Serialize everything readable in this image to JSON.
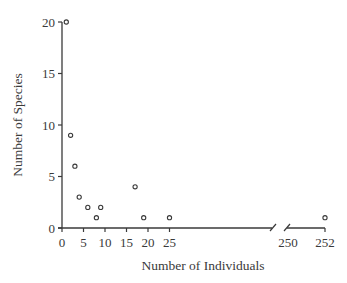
{
  "chart_data": {
    "type": "scatter",
    "title": "",
    "xlabel": "Number of Individuals",
    "ylabel": "Number of Species",
    "x_axis_break": {
      "from": 25,
      "to": 250
    },
    "xticks": [
      0,
      5,
      10,
      15,
      20,
      25,
      250,
      252
    ],
    "yticks": [
      0,
      5,
      10,
      15,
      20
    ],
    "ylim": [
      0,
      20
    ],
    "grid": false,
    "legend": null,
    "points": [
      {
        "x": 1,
        "y": 20
      },
      {
        "x": 2,
        "y": 9
      },
      {
        "x": 3,
        "y": 6
      },
      {
        "x": 4,
        "y": 3
      },
      {
        "x": 6,
        "y": 2
      },
      {
        "x": 8,
        "y": 1
      },
      {
        "x": 9,
        "y": 2
      },
      {
        "x": 17,
        "y": 4
      },
      {
        "x": 19,
        "y": 1
      },
      {
        "x": 25,
        "y": 1
      },
      {
        "x": 252,
        "y": 1
      }
    ]
  },
  "colors": {
    "axis": "#3a3a3a",
    "marker": "#3a3a3a"
  }
}
